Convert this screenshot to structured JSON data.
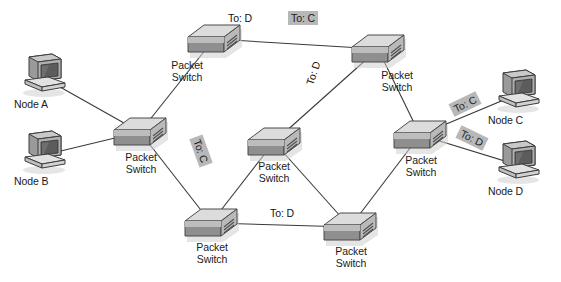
{
  "diagram": {
    "background_color": "#ffffff",
    "line_color": "#3a3a3a",
    "highlight_color": "#b8b8b8",
    "switch_label_text": "Packet\nSwitch",
    "switches": [
      {
        "id": "sw-top-left",
        "name": "Packet\nSwitch",
        "x": 186,
        "y": 19,
        "label_x": 158,
        "label_y": 60
      },
      {
        "id": "sw-top-right",
        "name": "Packet\nSwitch",
        "x": 350,
        "y": 29,
        "label_x": 368,
        "label_y": 70
      },
      {
        "id": "sw-left",
        "name": "Packet\nSwitch",
        "x": 112,
        "y": 112,
        "label_x": 112,
        "label_y": 152
      },
      {
        "id": "sw-center",
        "name": "Packet\nSwitch",
        "x": 246,
        "y": 122,
        "label_x": 245,
        "label_y": 161
      },
      {
        "id": "sw-right",
        "name": "Packet\nSwitch",
        "x": 392,
        "y": 115,
        "label_x": 392,
        "label_y": 155
      },
      {
        "id": "sw-bottom-left",
        "name": "Packet\nSwitch",
        "x": 183,
        "y": 203,
        "label_x": 183,
        "label_y": 242
      },
      {
        "id": "sw-bottom-right",
        "name": "Packet\nSwitch",
        "x": 322,
        "y": 207,
        "label_x": 322,
        "label_y": 246
      }
    ],
    "nodes": [
      {
        "id": "node-a",
        "label": "Node A",
        "x": 20,
        "y": 52,
        "label_x": 14,
        "label_y": 98
      },
      {
        "id": "node-b",
        "label": "Node B",
        "x": 20,
        "y": 129,
        "label_x": 14,
        "label_y": 175
      },
      {
        "id": "node-c",
        "label": "Node C",
        "x": 494,
        "y": 68,
        "label_x": 488,
        "label_y": 114
      },
      {
        "id": "node-d",
        "label": "Node D",
        "x": 494,
        "y": 139,
        "label_x": 488,
        "label_y": 185
      }
    ],
    "packet_labels": [
      {
        "id": "pkt-top-d",
        "text": "To: D",
        "x": 225,
        "y": 11,
        "rotate": 0,
        "highlighted": false
      },
      {
        "id": "pkt-top-c",
        "text": "To: C",
        "x": 288,
        "y": 11,
        "rotate": 0,
        "highlighted": true
      },
      {
        "id": "pkt-upper-mid-d",
        "text": "To: D",
        "x": 298,
        "y": 66,
        "rotate": -72,
        "highlighted": false
      },
      {
        "id": "pkt-left-c",
        "text": "To: C",
        "x": 186,
        "y": 144,
        "rotate": 70,
        "highlighted": true
      },
      {
        "id": "pkt-bottom-d",
        "text": "To: D",
        "x": 267,
        "y": 206,
        "rotate": 0,
        "highlighted": false
      },
      {
        "id": "pkt-right-c",
        "text": "To: C",
        "x": 450,
        "y": 97,
        "rotate": -26,
        "highlighted": true
      },
      {
        "id": "pkt-right-d",
        "text": "To: D",
        "x": 457,
        "y": 131,
        "rotate": 26,
        "highlighted": true
      }
    ],
    "links": [
      {
        "id": "link-node-a-sw-left",
        "from": "node-a",
        "to": "sw-left"
      },
      {
        "id": "link-node-b-sw-left",
        "from": "node-b",
        "to": "sw-left"
      },
      {
        "id": "link-sw-left-sw-top-left",
        "from": "sw-left",
        "to": "sw-top-left"
      },
      {
        "id": "link-sw-left-sw-bottom-left",
        "from": "sw-left",
        "to": "sw-bottom-left"
      },
      {
        "id": "link-sw-top-left-sw-top-right",
        "from": "sw-top-left",
        "to": "sw-top-right"
      },
      {
        "id": "link-sw-top-right-sw-center",
        "from": "sw-top-right",
        "to": "sw-center"
      },
      {
        "id": "link-sw-top-right-sw-right",
        "from": "sw-top-right",
        "to": "sw-right"
      },
      {
        "id": "link-sw-center-sw-bottom-left",
        "from": "sw-center",
        "to": "sw-bottom-left"
      },
      {
        "id": "link-sw-center-sw-bottom-right",
        "from": "sw-center",
        "to": "sw-bottom-right"
      },
      {
        "id": "link-sw-bottom-left-sw-bottom-right",
        "from": "sw-bottom-left",
        "to": "sw-bottom-right"
      },
      {
        "id": "link-sw-bottom-right-sw-right",
        "from": "sw-bottom-right",
        "to": "sw-right"
      },
      {
        "id": "link-sw-right-node-c",
        "from": "sw-right",
        "to": "node-c"
      },
      {
        "id": "link-sw-right-node-d",
        "from": "sw-right",
        "to": "node-d"
      }
    ]
  }
}
